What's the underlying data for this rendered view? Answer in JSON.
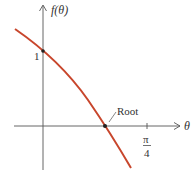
{
  "diagram": {
    "y_axis_label": "f(θ)",
    "x_axis_label": "θ",
    "y_intercept_label": "1",
    "root_label": "Root",
    "tick_label_num": "π",
    "tick_label_den": "4",
    "colors": {
      "curve": "#c8462c",
      "axis": "#555555",
      "point": "#222222"
    }
  }
}
